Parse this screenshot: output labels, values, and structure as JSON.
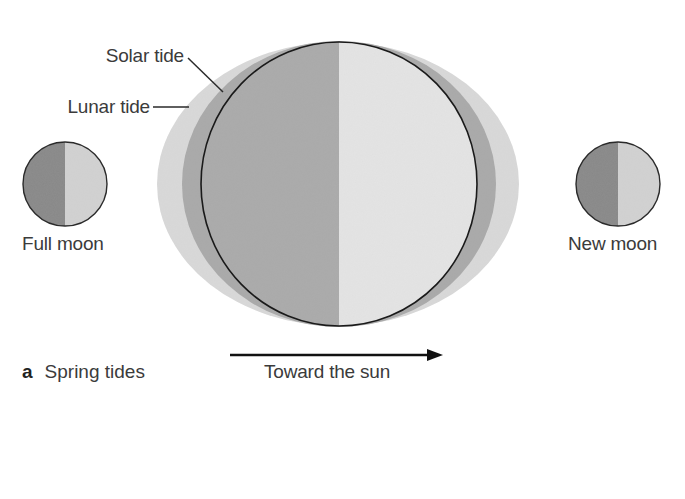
{
  "figure": {
    "panel_letter": "a",
    "panel_title": "Spring tides",
    "direction_label": "Toward the sun"
  },
  "labels": {
    "solar_tide": "Solar tide",
    "lunar_tide": "Lunar tide",
    "full_moon": "Full moon",
    "new_moon": "New moon"
  },
  "colors": {
    "background": "#ffffff",
    "solar_tide_fill": "#d9d9d9",
    "lunar_tide_fill": "#a9a9a9",
    "night_side": "#aaaaaa",
    "day_side": "#e4e4e4",
    "moon_dark_side": "#888888",
    "moon_light_side": "#d2d2d2",
    "outline": "#1a1a1a",
    "text": "#3b3b3b"
  },
  "shapes": {
    "earth": {
      "cx": 339,
      "cy": 184,
      "rx": 138,
      "ry": 142
    },
    "lunar_tide": {
      "cx": 339,
      "cy": 184,
      "rx": 157,
      "ry": 143
    },
    "solar_tide": {
      "cx": 338,
      "cy": 184,
      "rx": 181,
      "ry": 142
    },
    "full_moon": {
      "cx": 65,
      "cy": 184,
      "r": 42
    },
    "new_moon": {
      "cx": 618,
      "cy": 184,
      "r": 42
    },
    "arrow": {
      "x1": 230,
      "x2": 443,
      "y": 355
    }
  }
}
